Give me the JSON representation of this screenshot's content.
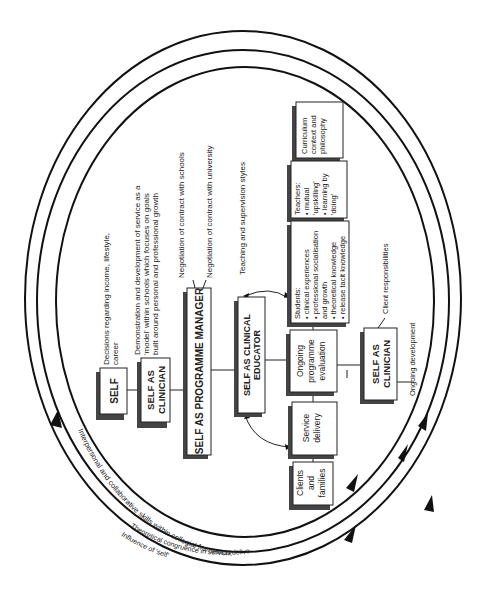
{
  "diagram": {
    "rings": [
      {
        "label": "Interpersonal and collaborative skills within collegial framework"
      },
      {
        "label": "Theoretical congruence in service delivery"
      },
      {
        "label": "Influence of 'self'"
      }
    ],
    "nodes": {
      "self": "SELF",
      "self_clinician_1": [
        "SELF AS",
        "CLINICIAN"
      ],
      "programme_manager": "SELF AS PROGRAMME MANAGER",
      "clinical_educator": [
        "SELF AS CLINICAL",
        "EDUCATOR"
      ],
      "clients": [
        "Clients",
        "and",
        "families"
      ],
      "service_delivery": [
        "Service",
        "delivery"
      ],
      "ongoing_evaluation": [
        "Ongoing",
        "programme",
        "evaluation"
      ],
      "students": [
        "Students:",
        "• clinical experiences",
        "• professional socialisation",
        "  and growth",
        "• theoretical knowledge",
        "• release tacit knowledge"
      ],
      "teachers": [
        "Teachers:",
        "• mutual",
        "  'upskilling'",
        "• learning by",
        "  'doing'"
      ],
      "curriculum": [
        "Curriculum",
        "context and",
        "philosophy"
      ],
      "self_clinician_2": [
        "SELF AS",
        "CLINICIAN"
      ]
    },
    "annotations": {
      "decisions": [
        "Decisions regarding income, lifestyle,",
        "career"
      ],
      "demonstration": [
        "Demonstration and development of service as a",
        "'model' within schools which focuses on goals",
        "built around personal and professional growth"
      ],
      "negotiation_schools": "Negotiation of contract with schools",
      "negotiation_university": "Negotiation of contract with university",
      "teaching_styles": "Teaching and supervision styles",
      "client_responsibilities": "Client responsibilities",
      "ongoing_development": "Ongoing development"
    }
  }
}
